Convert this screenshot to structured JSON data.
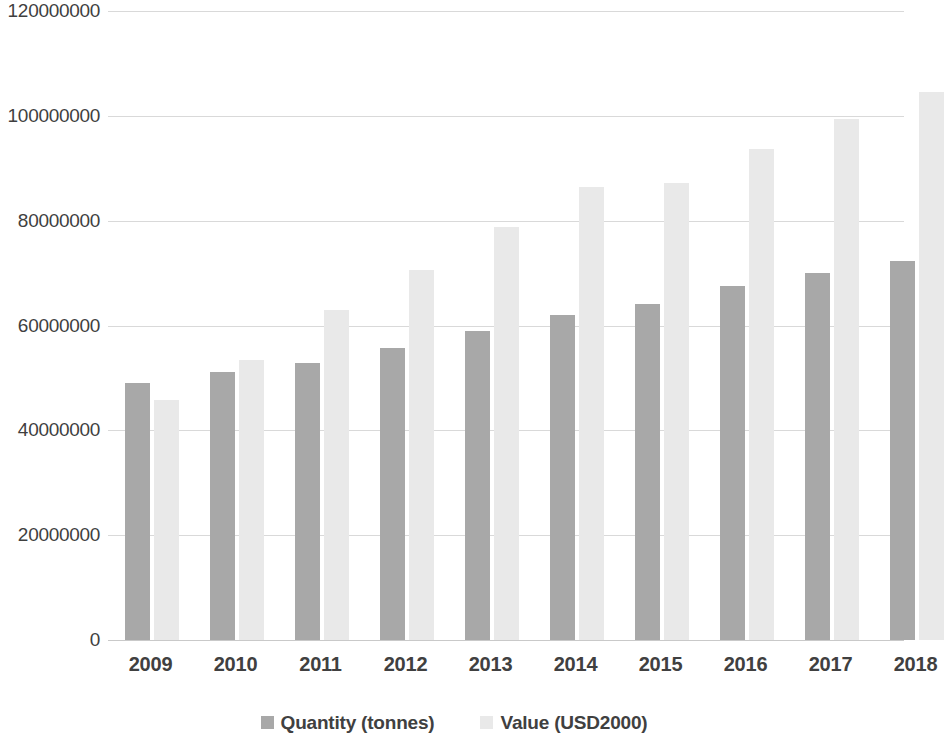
{
  "chart_data": {
    "type": "bar",
    "title": "",
    "subtitle": "",
    "xlabel": "",
    "ylabel": "",
    "categories": [
      "2009",
      "2010",
      "2011",
      "2012",
      "2013",
      "2014",
      "2015",
      "2016",
      "2017",
      "2018"
    ],
    "series": [
      {
        "name": "Quantity (tonnes)",
        "color": "#a8a8a8",
        "values": [
          49000000,
          51200000,
          52800000,
          55800000,
          58900000,
          62100000,
          64200000,
          67600000,
          70100000,
          72400000
        ]
      },
      {
        "name": "Value (USD2000)",
        "color": "#e9e9e9",
        "values": [
          45700000,
          53400000,
          62900000,
          70500000,
          78800000,
          86400000,
          87200000,
          93700000,
          99400000,
          104600000
        ]
      }
    ],
    "ylim": [
      0,
      120000000
    ],
    "yticks": [
      0,
      20000000,
      40000000,
      60000000,
      80000000,
      100000000,
      120000000
    ],
    "ytick_labels": [
      "0",
      "20000000",
      "40000000",
      "60000000",
      "80000000",
      "100000000",
      "120000000"
    ],
    "grid": true,
    "grid_axis": "y",
    "legend_position": "bottom",
    "bar_group_pitch": 85,
    "bar_width": 25,
    "plot_background": "#ffffff",
    "gridline_color": "#d9d9d9",
    "text_color": "#3f3f3f"
  }
}
